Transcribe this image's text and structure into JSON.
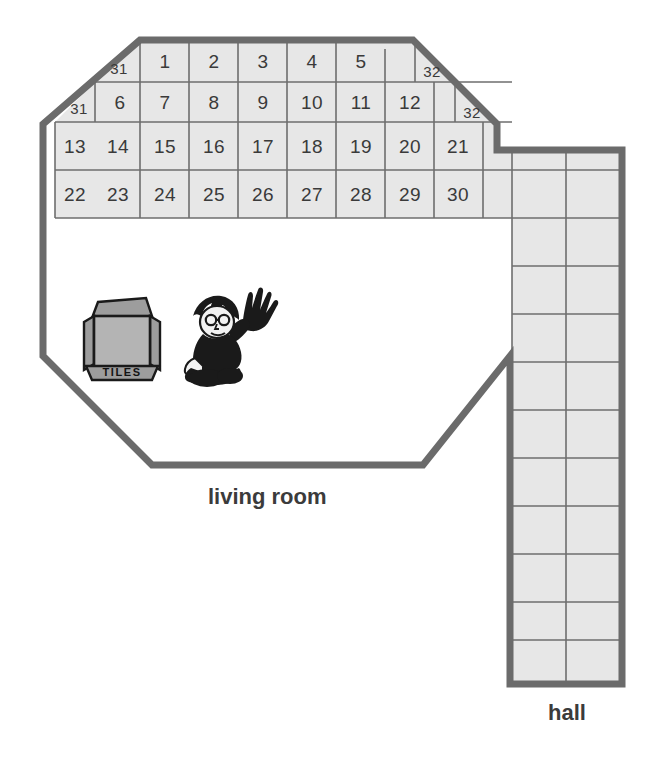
{
  "figure": {
    "kind": "floor-plan-tiling-diagram",
    "rooms": [
      {
        "id": "living-room",
        "label": "living room"
      },
      {
        "id": "hall",
        "label": "hall"
      }
    ]
  },
  "colors": {
    "tile_fill": "#e7e7e7",
    "tile_gridline": "#6e6e6e",
    "wall_outline": "#6b6b6b",
    "number_ink": "#3a3a3a",
    "label_ink": "#3b3b3b",
    "page_background": "#ffffff",
    "box_fill": "#a8a8a8",
    "figure_ink": "#1a1a1a"
  },
  "living_room": {
    "label": "living room",
    "tile_rows": [
      {
        "row": 1,
        "cells": [
          "31",
          "1",
          "2",
          "3",
          "4",
          "5",
          "32"
        ]
      },
      {
        "row": 2,
        "cells": [
          "31",
          "6",
          "7",
          "8",
          "9",
          "10",
          "11",
          "12",
          "32"
        ]
      },
      {
        "row": 3,
        "cells": [
          "13",
          "14",
          "15",
          "16",
          "17",
          "18",
          "19",
          "20",
          "21"
        ]
      },
      {
        "row": 4,
        "cells": [
          "22",
          "23",
          "24",
          "25",
          "26",
          "27",
          "28",
          "29",
          "30"
        ]
      }
    ],
    "half_tiles": [
      "31",
      "31",
      "32",
      "32"
    ],
    "highest_number": "32",
    "numbered_tile_count": "32"
  },
  "hall": {
    "label": "hall",
    "columns": 2,
    "rows": 11,
    "cells": []
  },
  "props": {
    "tile_box": {
      "name": "tiles-box",
      "label": "TILES"
    },
    "person": {
      "name": "person-kneeling",
      "label": ""
    }
  }
}
